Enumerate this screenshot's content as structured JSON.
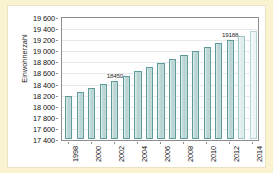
{
  "chart_data": {
    "type": "bar",
    "title": "",
    "xlabel": "",
    "ylabel": "Einwohnerzahl",
    "ylim": [
      17400,
      19600
    ],
    "ytick_step": 200,
    "yticks": [
      17400,
      17600,
      17800,
      18000,
      18200,
      18400,
      18600,
      18800,
      19000,
      19200,
      19400,
      19600
    ],
    "ytick_labels": [
      "17 400",
      "17 600",
      "17 800",
      "18 000",
      "18 200",
      "18 400",
      "18 600",
      "18 800",
      "19 000",
      "19 200",
      "19 400",
      "19 600"
    ],
    "categories": [
      1998,
      1999,
      2000,
      2001,
      2002,
      2003,
      2004,
      2005,
      2006,
      2007,
      2008,
      2009,
      2010,
      2011,
      2012,
      2013,
      2014
    ],
    "xtick_labels": [
      "1998",
      "2000",
      "2002",
      "2004",
      "2006",
      "2008",
      "2010",
      "2012",
      "2014"
    ],
    "xtick_categories": [
      1998,
      2000,
      2002,
      2004,
      2006,
      2008,
      2010,
      2012,
      2014
    ],
    "values": [
      18175,
      18245,
      18320,
      18400,
      18450,
      18540,
      18625,
      18690,
      18765,
      18845,
      18910,
      18985,
      19055,
      19125,
      19188,
      19265,
      19345
    ],
    "point_labels": [
      {
        "category": 2002,
        "value": 18450,
        "text": "18450"
      },
      {
        "category": 2012,
        "value": 19188,
        "text": "19188"
      }
    ],
    "series": [
      {
        "name": "Einwohnerzahl",
        "values": [
          18175,
          18245,
          18320,
          18400,
          18450,
          18540,
          18625,
          18690,
          18765,
          18845,
          18910,
          18985,
          19055,
          19125,
          19188,
          19265,
          19345
        ]
      }
    ],
    "bar_styles": [
      "normal",
      "normal",
      "normal",
      "normal",
      "normal",
      "normal",
      "normal",
      "normal",
      "normal",
      "normal",
      "normal",
      "normal",
      "normal",
      "normal",
      "normal",
      "light",
      "lighter"
    ],
    "grid": true,
    "grid_axis": "y",
    "legend": false,
    "colors": {
      "bar_fill": "#b3d2d0",
      "bar_edge": "#5f9b9b",
      "bar_fill_light": "#dceceb",
      "bar_fill_lighter": "#eaf5f4",
      "grid": "#e6eaea",
      "axis": "#8d8d8d",
      "plot_background": "#ffffff",
      "page_background": "#faf3cf",
      "text": "#111111"
    }
  }
}
